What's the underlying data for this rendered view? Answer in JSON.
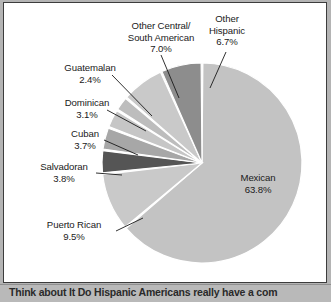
{
  "figure": {
    "background_color": "#ffffff",
    "page_background_color": "#b4b4b4",
    "border_color": "#3c3c3c"
  },
  "caption": {
    "text": "Think about It  Do Hispanic Americans really have a com"
  },
  "chart_data": {
    "type": "pie",
    "title": "",
    "xlabel": "",
    "ylabel": "",
    "legend_position": "none",
    "grid": false,
    "units": "percent",
    "start_angle_deg": 0,
    "direction": "clockwise",
    "categories": [
      "Mexican",
      "Puerto Rican",
      "Salvadoran",
      "Cuban",
      "Dominican",
      "Guatemalan",
      "Other Central/ South American",
      "Other Hispanic"
    ],
    "values": [
      63.8,
      9.5,
      3.8,
      3.7,
      3.1,
      2.4,
      7.0,
      6.7
    ],
    "slice_colors": [
      "#c3c3c3",
      "#c9c9c9",
      "#555555",
      "#a7a7a7",
      "#c6c6c6",
      "#bdbdbd",
      "#c9c9c9",
      "#8d8d8d"
    ],
    "slices": [
      {
        "label": "Mexican",
        "value_text": "63.8%",
        "value": 63.8,
        "color": "#c3c3c3",
        "label_placement": "inside"
      },
      {
        "label": "Puerto Rican",
        "value_text": "9.5%",
        "value": 9.5,
        "color": "#c9c9c9",
        "label_placement": "outside-left"
      },
      {
        "label": "Salvadoran",
        "value_text": "3.8%",
        "value": 3.8,
        "color": "#555555",
        "label_placement": "outside-left"
      },
      {
        "label": "Cuban",
        "value_text": "3.7%",
        "value": 3.7,
        "color": "#a7a7a7",
        "label_placement": "outside-left"
      },
      {
        "label": "Dominican",
        "value_text": "3.1%",
        "value": 3.1,
        "color": "#c6c6c6",
        "label_placement": "outside-left"
      },
      {
        "label": "Guatemalan",
        "value_text": "2.4%",
        "value": 2.4,
        "color": "#bdbdbd",
        "label_placement": "outside-left"
      },
      {
        "label": "Other Central/",
        "label_line2": "South American",
        "value_text": "7.0%",
        "value": 7.0,
        "color": "#c9c9c9",
        "label_placement": "outside-top"
      },
      {
        "label": "Other",
        "label_line2": "Hispanic",
        "value_text": "6.7%",
        "value": 6.7,
        "color": "#8d8d8d",
        "label_placement": "outside-top-right"
      }
    ]
  },
  "labels": {
    "mexican": {
      "name": "Mexican",
      "pct": "63.8%"
    },
    "puerto_rican": {
      "name": "Puerto Rican",
      "pct": "9.5%"
    },
    "salvadoran": {
      "name": "Salvadoran",
      "pct": "3.8%"
    },
    "cuban": {
      "name": "Cuban",
      "pct": "3.7%"
    },
    "dominican": {
      "name": "Dominican",
      "pct": "3.1%"
    },
    "guatemalan": {
      "name": "Guatemalan",
      "pct": "2.4%"
    },
    "other_cs_american": {
      "line1": "Other Central/",
      "line2": "South American",
      "pct": "7.0%"
    },
    "other_hispanic": {
      "line1": "Other",
      "line2": "Hispanic",
      "pct": "6.7%"
    }
  }
}
